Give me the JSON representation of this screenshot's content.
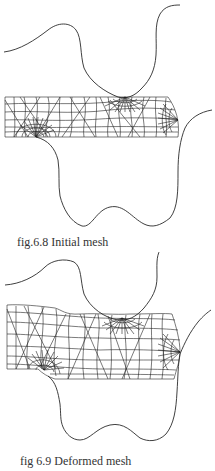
{
  "figures": [
    {
      "id": "fig-6-8",
      "caption": "fig.6.8 Initial mesh",
      "state": "initial"
    },
    {
      "id": "fig-6-9",
      "caption": "fig 6.9 Deformed mesh",
      "state": "deformed"
    }
  ],
  "colors": {
    "line": "#222222",
    "background": "#ffffff",
    "caption": "#333333"
  }
}
